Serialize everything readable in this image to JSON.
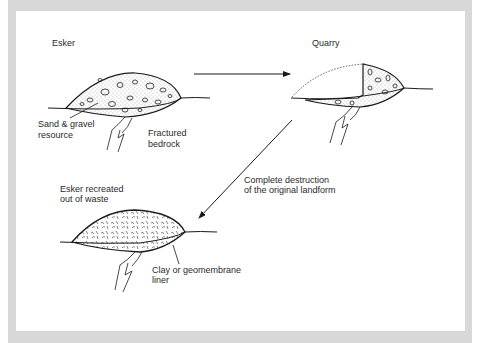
{
  "figure": {
    "panels": [
      {
        "id": "esker",
        "title": "Esker",
        "labels": [
          "Sand & gravel",
          "resource",
          "Fractured",
          "bedrock"
        ]
      },
      {
        "id": "quarry",
        "title": "Quarry"
      },
      {
        "id": "recreated",
        "title_lines": [
          "Esker recreated",
          "out of waste"
        ],
        "labels": [
          "Clay or geomembrane",
          "liner"
        ]
      }
    ],
    "arrows": [
      {
        "from": "esker",
        "to": "quarry"
      },
      {
        "from": "quarry",
        "to": "recreated",
        "caption_lines": [
          "Complete destruction",
          "of the original landform"
        ]
      }
    ]
  },
  "colors": {
    "frame": "#d8d8d8",
    "ink": "#1a1a1a",
    "panel": "#ffffff"
  }
}
